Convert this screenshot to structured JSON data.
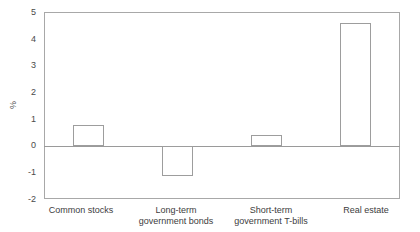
{
  "chart_data": {
    "type": "bar",
    "title": "",
    "xlabel": "",
    "ylabel": "%",
    "categories": [
      "Common stocks",
      "Long-term\ngovernment bonds",
      "Short-term\ngovernment T-bills",
      "Real estate"
    ],
    "values": [
      0.78,
      -1.15,
      0.41,
      4.59
    ],
    "ylim": [
      -2,
      5
    ],
    "yticks": [
      5,
      4,
      3,
      2,
      1,
      0,
      -1,
      -2
    ],
    "ytick_labels": [
      "5",
      "4",
      "3",
      "2",
      "1",
      "0",
      "-1",
      "-2"
    ],
    "grid": false,
    "legend": null,
    "bar_style": {
      "fill": "#ffffff",
      "edge": "#9d9d9d"
    },
    "axis_color": "#a8a8a8",
    "zero_line_color": "#9a9a9a"
  },
  "category_lines": {
    "c0": [
      "Common stocks",
      ""
    ],
    "c1": [
      "Long-term",
      "government bonds"
    ],
    "c2": [
      "Short-term",
      "government T-bills"
    ],
    "c3": [
      "Real estate",
      ""
    ]
  }
}
